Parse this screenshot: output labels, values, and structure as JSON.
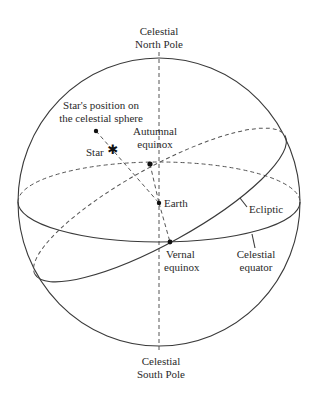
{
  "diagram": {
    "labels": {
      "north_pole_line1": "Celestial",
      "north_pole_line2": "North Pole",
      "south_pole_line1": "Celestial",
      "south_pole_line2": "South Pole",
      "star_position_line1": "Star's position on",
      "star_position_line2": "the celestial sphere",
      "star": "Star",
      "autumnal_line1": "Autumnal",
      "autumnal_line2": "equinox",
      "earth": "Earth",
      "ecliptic": "Ecliptic",
      "vernal_line1": "Vernal",
      "vernal_line2": "equinox",
      "equator_line1": "Celestial",
      "equator_line2": "equator"
    },
    "star_symbol": "✱",
    "colors": {
      "line": "#3a3a3a",
      "text": "#2a2a2a",
      "background": "#ffffff"
    }
  }
}
